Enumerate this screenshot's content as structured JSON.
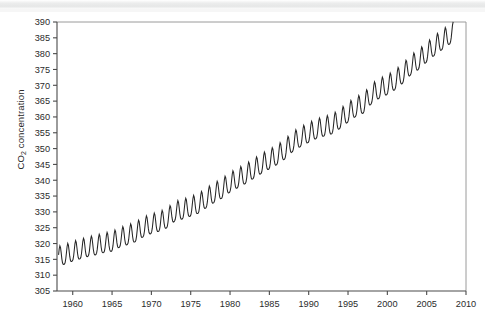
{
  "figure": {
    "name": "keeling-curve-figure",
    "background": "#ffffff",
    "line_color": "#262626",
    "axis_color": "#4a4a4a"
  },
  "axis_labels": {
    "y_label_prefix": "CO",
    "y_label_subscript": "2",
    "y_label_suffix": " concentration",
    "x_label": ""
  },
  "chart_data": {
    "type": "line",
    "title": "",
    "subtitle": "",
    "xlabel": "",
    "ylabel": "CO2 concentration",
    "xlim": [
      1958,
      2010
    ],
    "ylim": [
      305,
      390
    ],
    "grid": false,
    "legend": null,
    "legend_position": "none",
    "x_ticks": [
      1960,
      1965,
      1970,
      1975,
      1980,
      1985,
      1990,
      1995,
      2000,
      2005,
      2010
    ],
    "x_tick_labels": [
      "1960",
      "1965",
      "1970",
      "1975",
      "1980",
      "1985",
      "1990",
      "1995",
      "2000",
      "2005",
      "2010"
    ],
    "y_ticks": [
      305,
      310,
      315,
      320,
      325,
      330,
      335,
      340,
      345,
      350,
      355,
      360,
      365,
      370,
      375,
      380,
      385,
      390
    ],
    "y_tick_labels": [
      "305",
      "310",
      "315",
      "320",
      "325",
      "330",
      "335",
      "340",
      "345",
      "350",
      "355",
      "360",
      "365",
      "370",
      "375",
      "380",
      "385",
      "390"
    ],
    "series": [
      {
        "name": "Mauna Loa monthly mean CO2",
        "units": "ppm",
        "x_start": 1958.2,
        "x_end": 2008.4,
        "sampling": "monthly",
        "seasonal_amplitude_ppm": 6.2,
        "seasonal_peak_month": 5,
        "seasonal_trough_month": 10,
        "annual_means": [
          {
            "year": 1958,
            "value": 315.3
          },
          {
            "year": 1959,
            "value": 315.9
          },
          {
            "year": 1960,
            "value": 316.9
          },
          {
            "year": 1961,
            "value": 317.6
          },
          {
            "year": 1962,
            "value": 318.4
          },
          {
            "year": 1963,
            "value": 318.9
          },
          {
            "year": 1964,
            "value": 319.6
          },
          {
            "year": 1965,
            "value": 320.0
          },
          {
            "year": 1966,
            "value": 321.3
          },
          {
            "year": 1967,
            "value": 322.1
          },
          {
            "year": 1968,
            "value": 323.0
          },
          {
            "year": 1969,
            "value": 324.6
          },
          {
            "year": 1970,
            "value": 325.6
          },
          {
            "year": 1971,
            "value": 326.3
          },
          {
            "year": 1972,
            "value": 327.4
          },
          {
            "year": 1973,
            "value": 329.6
          },
          {
            "year": 1974,
            "value": 330.2
          },
          {
            "year": 1975,
            "value": 331.1
          },
          {
            "year": 1976,
            "value": 332.0
          },
          {
            "year": 1977,
            "value": 333.8
          },
          {
            "year": 1978,
            "value": 335.4
          },
          {
            "year": 1979,
            "value": 336.8
          },
          {
            "year": 1980,
            "value": 338.7
          },
          {
            "year": 1981,
            "value": 340.1
          },
          {
            "year": 1982,
            "value": 341.4
          },
          {
            "year": 1983,
            "value": 343.0
          },
          {
            "year": 1984,
            "value": 344.6
          },
          {
            "year": 1985,
            "value": 346.0
          },
          {
            "year": 1986,
            "value": 347.4
          },
          {
            "year": 1987,
            "value": 349.2
          },
          {
            "year": 1988,
            "value": 351.6
          },
          {
            "year": 1989,
            "value": 353.1
          },
          {
            "year": 1990,
            "value": 354.4
          },
          {
            "year": 1991,
            "value": 355.6
          },
          {
            "year": 1992,
            "value": 356.4
          },
          {
            "year": 1993,
            "value": 357.1
          },
          {
            "year": 1994,
            "value": 358.8
          },
          {
            "year": 1995,
            "value": 360.8
          },
          {
            "year": 1996,
            "value": 362.6
          },
          {
            "year": 1997,
            "value": 363.7
          },
          {
            "year": 1998,
            "value": 366.7
          },
          {
            "year": 1999,
            "value": 368.4
          },
          {
            "year": 2000,
            "value": 369.5
          },
          {
            "year": 2001,
            "value": 371.1
          },
          {
            "year": 2002,
            "value": 373.2
          },
          {
            "year": 2003,
            "value": 375.8
          },
          {
            "year": 2004,
            "value": 377.5
          },
          {
            "year": 2005,
            "value": 379.8
          },
          {
            "year": 2006,
            "value": 381.9
          },
          {
            "year": 2007,
            "value": 383.8
          },
          {
            "year": 2008,
            "value": 385.6
          }
        ],
        "min_value": 312.9,
        "max_value": 389.9
      }
    ]
  }
}
